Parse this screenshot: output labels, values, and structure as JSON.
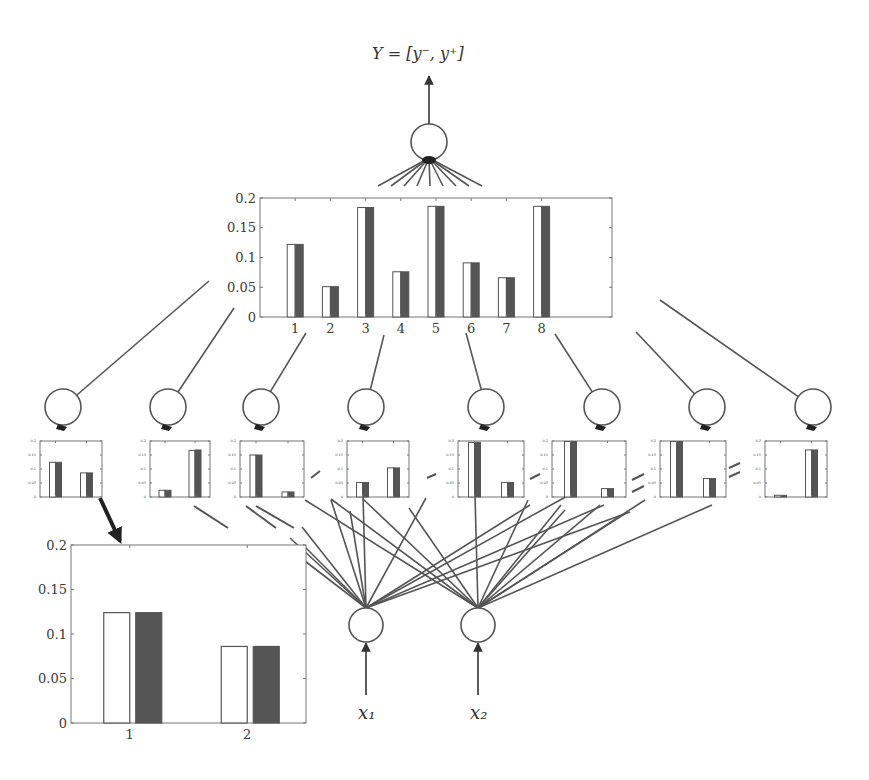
{
  "diagram": {
    "output_label": "Y = [y⁻, y⁺]",
    "input_labels": [
      "x₁",
      "x₂"
    ],
    "colors": {
      "line": "#555555",
      "bar_dark": "#555555",
      "bar_light": "#ffffff",
      "axes": "#777777",
      "text": "#3a3a3a"
    }
  },
  "chart_data": [
    {
      "id": "top-output-distribution",
      "type": "bar",
      "title": "",
      "xlabel": "",
      "ylabel": "",
      "categories": [
        "1",
        "2",
        "3",
        "4",
        "5",
        "6",
        "7",
        "8"
      ],
      "series": [
        {
          "name": "lower (white)",
          "values": [
            0.122,
            0.051,
            0.184,
            0.076,
            0.186,
            0.091,
            0.066,
            0.186
          ]
        },
        {
          "name": "upper (dark)",
          "values": [
            0.122,
            0.051,
            0.184,
            0.076,
            0.186,
            0.091,
            0.066,
            0.186
          ]
        }
      ],
      "yticks": [
        "0",
        "0.05",
        "0.1",
        "0.15",
        "0.2"
      ],
      "ylim": [
        0,
        0.2
      ],
      "xlim": [
        0,
        10
      ],
      "grid": false,
      "legend": null
    },
    {
      "id": "rule-node-1",
      "type": "bar",
      "categories": [
        "1",
        "2"
      ],
      "series": [
        {
          "name": "lower (white)",
          "values": [
            0.124,
            0.086
          ]
        },
        {
          "name": "upper (dark)",
          "values": [
            0.124,
            0.086
          ]
        }
      ],
      "yticks": [
        "0",
        "0.05",
        "0.1",
        "0.15",
        "0.2"
      ],
      "ylim": [
        0,
        0.2
      ]
    },
    {
      "id": "rule-node-2",
      "type": "bar",
      "categories": [
        "1",
        "2"
      ],
      "series": [
        {
          "name": "lower (white)",
          "values": [
            0.024,
            0.166
          ]
        },
        {
          "name": "upper (dark)",
          "values": [
            0.024,
            0.168
          ]
        }
      ],
      "yticks": [
        "0",
        "0.05",
        "0.1",
        "0.15",
        "0.2"
      ],
      "ylim": [
        0,
        0.2
      ]
    },
    {
      "id": "rule-node-3",
      "type": "bar",
      "categories": [
        "1",
        "2"
      ],
      "series": [
        {
          "name": "lower (white)",
          "values": [
            0.15,
            0.018
          ]
        },
        {
          "name": "upper (dark)",
          "values": [
            0.15,
            0.018
          ]
        }
      ],
      "yticks": [
        "0",
        "0.05",
        "0.1",
        "0.15",
        "0.2"
      ],
      "ylim": [
        0,
        0.2
      ]
    },
    {
      "id": "rule-node-4",
      "type": "bar",
      "categories": [
        "1",
        "2"
      ],
      "series": [
        {
          "name": "lower (white)",
          "values": [
            0.052,
            0.104
          ]
        },
        {
          "name": "upper (dark)",
          "values": [
            0.052,
            0.104
          ]
        }
      ],
      "yticks": [
        "0",
        "0.05",
        "0.1",
        "0.15",
        "0.2"
      ],
      "ylim": [
        0,
        0.2
      ]
    },
    {
      "id": "rule-node-5",
      "type": "bar",
      "categories": [
        "1",
        "2"
      ],
      "series": [
        {
          "name": "lower (white)",
          "values": [
            0.195,
            0.052
          ]
        },
        {
          "name": "upper (dark)",
          "values": [
            0.195,
            0.052
          ]
        }
      ],
      "yticks": [
        "0",
        "0.05",
        "0.1",
        "0.15",
        "0.2"
      ],
      "ylim": [
        0,
        0.2
      ]
    },
    {
      "id": "rule-node-6",
      "type": "bar",
      "categories": [
        "1",
        "2"
      ],
      "series": [
        {
          "name": "lower (white)",
          "values": [
            0.198,
            0.03
          ]
        },
        {
          "name": "upper (dark)",
          "values": [
            0.198,
            0.03
          ]
        }
      ],
      "yticks": [
        "0",
        "0.05",
        "0.1",
        "0.15",
        "0.2"
      ],
      "ylim": [
        0,
        0.2
      ]
    },
    {
      "id": "rule-node-7",
      "type": "bar",
      "categories": [
        "1",
        "2"
      ],
      "series": [
        {
          "name": "lower (white)",
          "values": [
            0.198,
            0.066
          ]
        },
        {
          "name": "upper (dark)",
          "values": [
            0.198,
            0.066
          ]
        }
      ],
      "yticks": [
        "0",
        "0.05",
        "0.1",
        "0.15",
        "0.2"
      ],
      "ylim": [
        0,
        0.2
      ]
    },
    {
      "id": "rule-node-8",
      "type": "bar",
      "categories": [
        "1",
        "2"
      ],
      "series": [
        {
          "name": "lower (white)",
          "values": [
            0.006,
            0.168
          ]
        },
        {
          "name": "upper (dark)",
          "values": [
            0.006,
            0.168
          ]
        }
      ],
      "yticks": [
        "0",
        "0.05",
        "0.1",
        "0.15",
        "0.2"
      ],
      "ylim": [
        0,
        0.2
      ]
    },
    {
      "id": "enlarged-rule-node-1",
      "type": "bar",
      "categories": [
        "1",
        "2"
      ],
      "series": [
        {
          "name": "lower (white)",
          "values": [
            0.124,
            0.086
          ]
        },
        {
          "name": "upper (dark)",
          "values": [
            0.124,
            0.086
          ]
        }
      ],
      "yticks": [
        "0",
        "0.05",
        "0.1",
        "0.15",
        "0.2"
      ],
      "ylim": [
        0,
        0.2
      ],
      "xlim": [
        0.5,
        2.5
      ]
    }
  ]
}
